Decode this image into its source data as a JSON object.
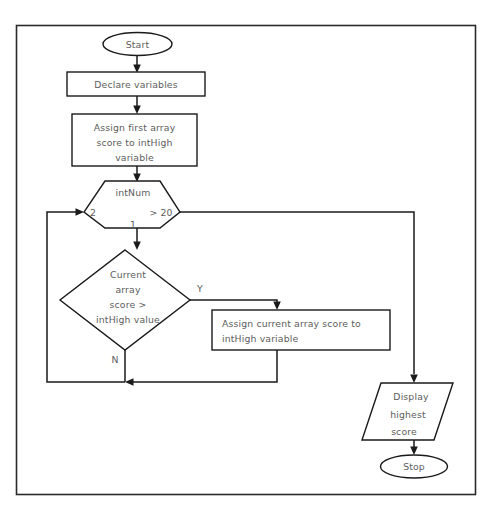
{
  "diagram": {
    "background_color": "#ffffff",
    "line_color": "#1a1a1a",
    "text_color": "#5d5d5d",
    "frame": {
      "color": "#2b2b2b"
    },
    "nodes": {
      "start": {
        "label": "Start",
        "shape": "terminator"
      },
      "declare": {
        "label": "Declare variables",
        "shape": "process"
      },
      "assign_first": {
        "line1": "Assign first array",
        "line2": "score to intHigh",
        "line3": "variable",
        "shape": "process"
      },
      "loop": {
        "label": "intNum",
        "start_value": "2",
        "condition": "> 20",
        "step": "1",
        "shape": "hexagon-loop"
      },
      "decision": {
        "line1": "Current",
        "line2": "array",
        "line3": "score >",
        "line4": "intHigh value",
        "shape": "decision"
      },
      "assign_current": {
        "line1": "Assign current array score to",
        "line2": "intHigh variable",
        "shape": "process"
      },
      "display": {
        "line1": "Display",
        "line2": "highest",
        "line3": "score",
        "shape": "output-parallelogram"
      },
      "stop": {
        "label": "Stop",
        "shape": "terminator"
      }
    },
    "edge_labels": {
      "yes": "Y",
      "no": "N"
    }
  }
}
